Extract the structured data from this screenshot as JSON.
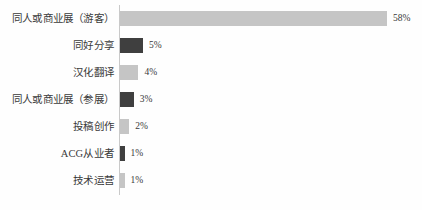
{
  "chart_data": {
    "type": "bar",
    "orientation": "horizontal",
    "title": "",
    "subtitle": "",
    "xlabel": "",
    "ylabel": "",
    "grid": false,
    "legend": null,
    "axis_line": true,
    "xlim": [
      0,
      58
    ],
    "value_suffix": "%",
    "categories": [
      "同人或商业展（游客）",
      "同好分享",
      "汉化翻译",
      "同人或商业展（参展）",
      "投稿创作",
      "ACG从业者",
      "技术运营"
    ],
    "values": [
      58,
      5,
      4,
      3,
      2,
      1,
      1
    ],
    "value_labels": [
      "58%",
      "5%",
      "4%",
      "3%",
      "2%",
      "1%",
      "1%"
    ],
    "bar_colors": [
      "#c5c5c5",
      "#3f3f3f",
      "#c5c5c5",
      "#3f3f3f",
      "#c5c5c5",
      "#3f3f3f",
      "#c5c5c5"
    ]
  },
  "style": {
    "background": "#fefefe",
    "axis_color": "#c9c9c9",
    "text_color": "#3a3a3a",
    "light_bar": "#c5c5c5",
    "dark_bar": "#3f3f3f"
  }
}
